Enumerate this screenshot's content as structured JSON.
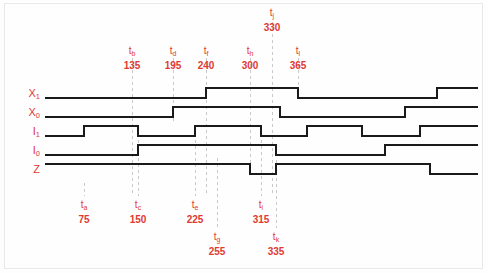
{
  "diagram": {
    "kind": "digital-timing-diagram",
    "colors": {
      "wave": "#1a1a1a",
      "annotation": "#e03a33",
      "guide": "#c9c9c9",
      "background": "#fefefe",
      "frame": "#e9e9e9"
    },
    "signals": [
      {
        "id": "X1",
        "name": "X",
        "subscript": "1",
        "label": "X1",
        "row_y": 94
      },
      {
        "id": "X0",
        "name": "X",
        "subscript": "0",
        "label": "X0",
        "row_y": 113
      },
      {
        "id": "I1",
        "name": "I",
        "subscript": "1",
        "label": "I1",
        "row_y": 132
      },
      {
        "id": "I0",
        "name": "I",
        "subscript": "0",
        "label": "I0",
        "row_y": 151
      },
      {
        "id": "Z",
        "name": "Z",
        "subscript": "",
        "label": "Z",
        "row_y": 170
      }
    ],
    "time_markers_top": [
      {
        "id": "tb",
        "name": "t",
        "subscript": "b",
        "value": "135",
        "x": 132,
        "label_x": 132,
        "label_y": 46
      },
      {
        "id": "td",
        "name": "t",
        "subscript": "d",
        "value": "195",
        "x": 173,
        "label_x": 173,
        "label_y": 46
      },
      {
        "id": "tf",
        "name": "t",
        "subscript": "f",
        "value": "240",
        "x": 206,
        "label_x": 206,
        "label_y": 46
      },
      {
        "id": "th",
        "name": "t",
        "subscript": "h",
        "value": "300",
        "x": 250,
        "label_x": 250,
        "label_y": 46
      },
      {
        "id": "tj",
        "name": "t",
        "subscript": "j",
        "value": "330",
        "x": 272,
        "label_x": 272,
        "label_y": 8
      },
      {
        "id": "tl",
        "name": "t",
        "subscript": "l",
        "value": "365",
        "x": 298,
        "label_x": 298,
        "label_y": 46
      }
    ],
    "time_markers_bottom": [
      {
        "id": "ta",
        "name": "t",
        "subscript": "a",
        "value": "75",
        "x": 84,
        "label_x": 84,
        "label_y": 200
      },
      {
        "id": "tc",
        "name": "t",
        "subscript": "c",
        "value": "150",
        "x": 138,
        "label_x": 138,
        "label_y": 200
      },
      {
        "id": "te",
        "name": "t",
        "subscript": "e",
        "value": "225",
        "x": 195,
        "label_x": 195,
        "label_y": 200
      },
      {
        "id": "tg",
        "name": "t",
        "subscript": "g",
        "value": "255",
        "x": 217,
        "label_x": 217,
        "label_y": 232
      },
      {
        "id": "ti",
        "name": "t",
        "subscript": "i",
        "value": "315",
        "x": 261,
        "label_x": 261,
        "label_y": 200
      },
      {
        "id": "tk",
        "name": "t",
        "subscript": "k",
        "value": "335",
        "x": 276,
        "label_x": 276,
        "label_y": 232
      }
    ],
    "waveforms": {
      "X1": {
        "low_y": 98,
        "high_y": 88,
        "start_x": 45,
        "end_x": 478,
        "transitions": [
          {
            "x": 206,
            "to": "high"
          },
          {
            "x": 298,
            "to": "low"
          },
          {
            "x": 437,
            "to": "high"
          }
        ]
      },
      "X0": {
        "low_y": 117,
        "high_y": 107,
        "start_x": 45,
        "end_x": 478,
        "transitions": [
          {
            "x": 173,
            "to": "high"
          },
          {
            "x": 280,
            "to": "low"
          },
          {
            "x": 405,
            "to": "high"
          }
        ]
      },
      "I1": {
        "low_y": 136,
        "high_y": 126,
        "start_x": 45,
        "end_x": 478,
        "transitions": [
          {
            "x": 84,
            "to": "high"
          },
          {
            "x": 138,
            "to": "low"
          },
          {
            "x": 195,
            "to": "high"
          },
          {
            "x": 261,
            "to": "low"
          },
          {
            "x": 307,
            "to": "high"
          },
          {
            "x": 362,
            "to": "low"
          },
          {
            "x": 420,
            "to": "high"
          }
        ]
      },
      "I0": {
        "low_y": 155,
        "high_y": 145,
        "start_x": 45,
        "end_x": 478,
        "transitions": [
          {
            "x": 138,
            "to": "high"
          },
          {
            "x": 276,
            "to": "low"
          },
          {
            "x": 385,
            "to": "high"
          }
        ]
      },
      "Z": {
        "low_y": 174,
        "high_y": 164,
        "start_x": 45,
        "end_x": 478,
        "transitions": [
          {
            "x": 250,
            "to": "low"
          },
          {
            "x": 276,
            "to": "high"
          },
          {
            "x": 430,
            "to": "low"
          }
        ],
        "initial": "high"
      }
    },
    "guides": [
      {
        "for": "ta",
        "x": 84,
        "y1": 183,
        "y2": 196
      },
      {
        "for": "tb",
        "x": 132,
        "y1": 58,
        "y2": 196
      },
      {
        "for": "tc",
        "x": 138,
        "y1": 140,
        "y2": 196
      },
      {
        "for": "td",
        "x": 173,
        "y1": 58,
        "y2": 122
      },
      {
        "for": "te",
        "x": 195,
        "y1": 140,
        "y2": 196
      },
      {
        "for": "tf",
        "x": 206,
        "y1": 58,
        "y2": 196
      },
      {
        "for": "tg",
        "x": 217,
        "y1": 158,
        "y2": 228
      },
      {
        "for": "th",
        "x": 250,
        "y1": 58,
        "y2": 172
      },
      {
        "for": "ti",
        "x": 261,
        "y1": 140,
        "y2": 196
      },
      {
        "for": "tj",
        "x": 272,
        "y1": 22,
        "y2": 196
      },
      {
        "for": "tk",
        "x": 276,
        "y1": 160,
        "y2": 228
      },
      {
        "for": "tl",
        "x": 298,
        "y1": 58,
        "y2": 92
      }
    ]
  }
}
